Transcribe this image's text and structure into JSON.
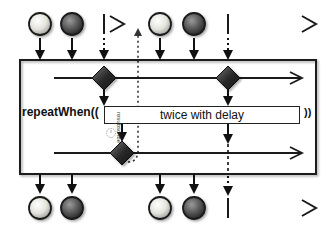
{
  "diagram": {
    "operator_label": "repeatWhen((",
    "operator_close": "))",
    "notifier_label": "twice with delay",
    "resubscribe_label": "resubscribe",
    "colors": {
      "line": "#1a1a1a",
      "marble_light": "#e8e8e0",
      "marble_dark": "#4a4a4a",
      "diamond": "#2b2b2b",
      "box_border": "#1a1a1a",
      "clock_icon": "#b0b0b0"
    },
    "source_timeline": {
      "segments": [
        {
          "x_start": 20,
          "x_end": 125,
          "completion_x": 104
        },
        {
          "x_start": 136,
          "x_end": 318,
          "completion_x": 228
        }
      ],
      "marbles": [
        {
          "x": 40,
          "shade": "light"
        },
        {
          "x": 72,
          "shade": "dark"
        },
        {
          "x": 160,
          "shade": "light"
        },
        {
          "x": 194,
          "shade": "dark"
        }
      ]
    },
    "output_timeline": {
      "marbles": [
        {
          "x": 40,
          "shade": "light"
        },
        {
          "x": 72,
          "shade": "dark"
        },
        {
          "x": 160,
          "shade": "light"
        },
        {
          "x": 194,
          "shade": "dark"
        }
      ],
      "completion_x": 228
    },
    "notification_diamonds": [
      {
        "x": 104,
        "y": 78
      },
      {
        "x": 228,
        "y": 78
      },
      {
        "x": 122,
        "y": 153
      }
    ]
  }
}
